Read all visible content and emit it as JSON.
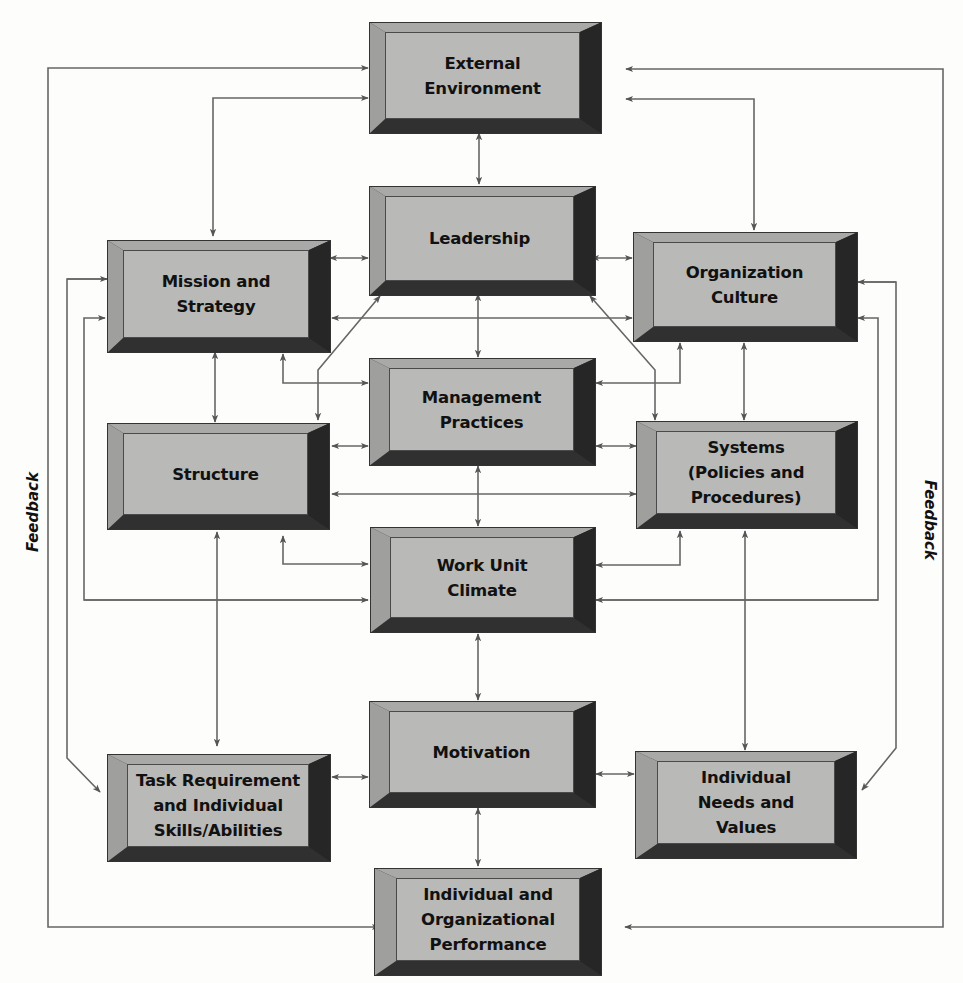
{
  "diagram": {
    "type": "causal-model",
    "colors": {
      "box_face": "#b9b9b7",
      "box_top_bevel": "#a9a9a7",
      "box_left_bevel": "#9f9f9d",
      "box_right_shadow": "#2a2a2a",
      "box_bottom_shadow": "#303030",
      "connector": "#606060",
      "text": "#111111"
    },
    "boxes": {
      "external_environment": "External\nEnvironment",
      "leadership": "Leadership",
      "mission_strategy": "Mission and\nStrategy",
      "organization_culture": "Organization\nCulture",
      "management_practices": "Management\nPractices",
      "structure": "Structure",
      "systems": "Systems\n(Policies and\nProcedures)",
      "work_unit_climate": "Work Unit\nClimate",
      "motivation": "Motivation",
      "task_requirement": "Task Requirement\nand Individual\nSkills/Abilities",
      "individual_needs": "Individual\nNeeds and\nValues",
      "performance": "Individual and\nOrganizational\nPerformance"
    },
    "side_labels": {
      "left": "Feedback",
      "right": "Feedback"
    },
    "connections": [
      {
        "from": "External Environment",
        "to": "Leadership",
        "direction": "both"
      },
      {
        "from": "External Environment",
        "to": "Mission and Strategy",
        "direction": "both"
      },
      {
        "from": "External Environment",
        "to": "Organization Culture",
        "direction": "both"
      },
      {
        "from": "Leadership",
        "to": "Mission and Strategy",
        "direction": "both"
      },
      {
        "from": "Leadership",
        "to": "Organization Culture",
        "direction": "both"
      },
      {
        "from": "Leadership",
        "to": "Management Practices",
        "direction": "both"
      },
      {
        "from": "Leadership",
        "to": "Structure",
        "direction": "both"
      },
      {
        "from": "Leadership",
        "to": "Systems",
        "direction": "both"
      },
      {
        "from": "Mission and Strategy",
        "to": "Organization Culture",
        "direction": "both"
      },
      {
        "from": "Mission and Strategy",
        "to": "Structure",
        "direction": "both"
      },
      {
        "from": "Mission and Strategy",
        "to": "Management Practices",
        "direction": "both"
      },
      {
        "from": "Organization Culture",
        "to": "Systems",
        "direction": "both"
      },
      {
        "from": "Organization Culture",
        "to": "Management Practices",
        "direction": "both"
      },
      {
        "from": "Management Practices",
        "to": "Structure",
        "direction": "both"
      },
      {
        "from": "Management Practices",
        "to": "Systems",
        "direction": "both"
      },
      {
        "from": "Management Practices",
        "to": "Work Unit Climate",
        "direction": "both"
      },
      {
        "from": "Structure",
        "to": "Systems",
        "direction": "both"
      },
      {
        "from": "Structure",
        "to": "Work Unit Climate",
        "direction": "both"
      },
      {
        "from": "Systems",
        "to": "Work Unit Climate",
        "direction": "both"
      },
      {
        "from": "Structure",
        "to": "Task Requirement and Individual Skills/Abilities",
        "direction": "both"
      },
      {
        "from": "Systems",
        "to": "Individual Needs and Values",
        "direction": "both"
      },
      {
        "from": "Work Unit Climate",
        "to": "Motivation",
        "direction": "both"
      },
      {
        "from": "Motivation",
        "to": "Task Requirement and Individual Skills/Abilities",
        "direction": "both"
      },
      {
        "from": "Motivation",
        "to": "Individual Needs and Values",
        "direction": "both"
      },
      {
        "from": "Motivation",
        "to": "Individual and Organizational Performance",
        "direction": "both"
      },
      {
        "from": "Individual and Organizational Performance",
        "to": "External Environment",
        "direction": "feedback"
      },
      {
        "from": "Mission and Strategy",
        "to": "Work Unit Climate",
        "direction": "feedback"
      },
      {
        "from": "Organization Culture",
        "to": "Work Unit Climate",
        "direction": "feedback"
      }
    ]
  }
}
